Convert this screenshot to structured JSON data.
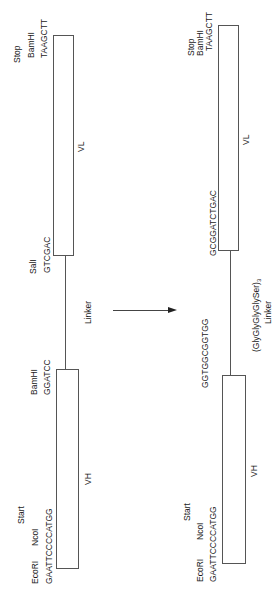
{
  "before": {
    "vl": {
      "label": "VL",
      "top_site": {
        "feature": "Stop",
        "enzyme": "BamHI",
        "sequence": "TAAGCTT"
      },
      "bottom_site": {
        "enzyme": "SalI",
        "sequence": "GTCGAC"
      }
    },
    "linker": {
      "label": "Linker"
    },
    "vh": {
      "label": "VH",
      "top_site": {
        "enzyme": "BamHI",
        "sequence": "GGATCC"
      },
      "bottom_site": {
        "feature": "Start",
        "enzyme_1": "NcoI",
        "enzyme_2": "EcoRI",
        "sequence": "GAATTCCCCATGG"
      }
    }
  },
  "after": {
    "vl": {
      "label": "VL",
      "top_site": {
        "feature": "Stop",
        "enzyme": "BamHI",
        "sequence": "TAAGCTT"
      },
      "bottom_sequence": "GCGGATCTGAC"
    },
    "linker": {
      "peptide": "(GlyGlyGlyGlySer)",
      "repeat": "3",
      "label": "Linker"
    },
    "vh": {
      "label": "VH",
      "top_sequence": "GGTGGCGGTGG",
      "bottom_site": {
        "feature": "Start",
        "enzyme_1": "NcoI",
        "enzyme_2": "EcoRI",
        "sequence": "GAATTCCCCATGG"
      }
    }
  },
  "transition_arrow": {
    "direction": "right"
  }
}
